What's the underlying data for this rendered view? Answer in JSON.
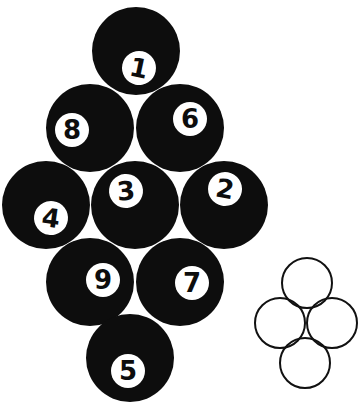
{
  "diagram": {
    "ball_color": "#0d0d0d",
    "number_bg": "#ffffff",
    "balls": [
      {
        "label": "1",
        "cx": 136,
        "cy": 51,
        "r": 44,
        "nx": 139,
        "ny": 68,
        "rot": 12
      },
      {
        "label": "8",
        "cx": 90,
        "cy": 128,
        "r": 44,
        "nx": 72,
        "ny": 130,
        "rot": 0
      },
      {
        "label": "6",
        "cx": 180,
        "cy": 128,
        "r": 44,
        "nx": 190,
        "ny": 119,
        "rot": 0
      },
      {
        "label": "4",
        "cx": 46,
        "cy": 205,
        "r": 44,
        "nx": 51,
        "ny": 218,
        "rot": 8
      },
      {
        "label": "3",
        "cx": 135,
        "cy": 205,
        "r": 44,
        "nx": 126,
        "ny": 191,
        "rot": -5
      },
      {
        "label": "2",
        "cx": 224,
        "cy": 205,
        "r": 44,
        "nx": 225,
        "ny": 189,
        "rot": 10
      },
      {
        "label": "9",
        "cx": 90,
        "cy": 282,
        "r": 44,
        "nx": 103,
        "ny": 280,
        "rot": 0
      },
      {
        "label": "7",
        "cx": 180,
        "cy": 282,
        "r": 44,
        "nx": 192,
        "ny": 283,
        "rot": 0
      },
      {
        "label": "5",
        "cx": 130,
        "cy": 358,
        "r": 44,
        "nx": 128,
        "ny": 371,
        "rot": 0
      }
    ],
    "outline_circles": [
      {
        "name": "top",
        "cx": 307,
        "cy": 283,
        "r": 26
      },
      {
        "name": "left",
        "cx": 280,
        "cy": 323,
        "r": 26
      },
      {
        "name": "right",
        "cx": 332,
        "cy": 323,
        "r": 26
      },
      {
        "name": "bottom",
        "cx": 305,
        "cy": 363,
        "r": 26
      }
    ]
  }
}
